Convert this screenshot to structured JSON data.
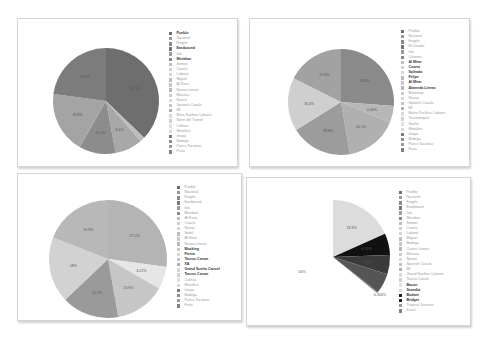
{
  "chart_data": [
    {
      "type": "pie",
      "title": "",
      "slices": [
        {
          "label": "37.2%",
          "value": 37.2,
          "color": "#6e6e6e"
        },
        {
          "label": "",
          "value": 1.5,
          "color": "#bdbdbd"
        },
        {
          "label": "8.4%",
          "value": 8.4,
          "color": "#a8a8a8"
        },
        {
          "label": "11.2%",
          "value": 11.2,
          "color": "#8c8c8c"
        },
        {
          "label": "18.8%",
          "value": 18.8,
          "color": "#a4a4a4"
        },
        {
          "label": "22.9%",
          "value": 22.9,
          "color": "#7c7c7c"
        }
      ],
      "legend": [
        "Pueblo",
        "Nacional",
        "Fragile",
        "Eastbound",
        "Isla",
        "Meridian",
        "Somos",
        "Cuarto",
        "Laboral",
        "Miguel",
        "Al Reos",
        "Nueva Lineas",
        "Mocana",
        "Nouvo",
        "Spanish Canals",
        "Ml",
        "Brisa Sueños Cabaret",
        "Norte del Tunnel",
        "Colinas",
        "Metallico",
        "Ixtapa",
        "Bodega",
        "Pasco Tacanao",
        "Fruta"
      ],
      "legend_bold": [
        0,
        3,
        5
      ],
      "legend_position": "right"
    },
    {
      "type": "pie",
      "title": "",
      "slices": [
        {
          "label": "26.2%",
          "value": 26.2,
          "color": "#8a8a8a"
        },
        {
          "label": "0.06%",
          "value": 5.0,
          "color": "#b7b7b7"
        },
        {
          "label": "16.1%",
          "value": 16.1,
          "color": "#b0b0b0"
        },
        {
          "label": "18.8%",
          "value": 18.8,
          "color": "#9c9c9c"
        },
        {
          "label": "16.3%",
          "value": 16.3,
          "color": "#cfcfcf"
        },
        {
          "label": "17.8%",
          "value": 17.6,
          "color": "#a2a2a2"
        }
      ],
      "legend": [
        "Pueblo",
        "Nacional",
        "Fragile",
        "El Dorado",
        "Isla",
        "Cosmos",
        "Al Mirar",
        "Cuarto",
        "Soleado",
        "Felipe",
        "Al Mirar",
        "Alameda Lineas",
        "Monterey",
        "Nuevo",
        "Spanish Canals",
        "Ml",
        "Bahía Pacífico Cabaret",
        "Tauromaquia",
        "Sueño",
        "Metallico",
        "Ixtapa",
        "Bodega",
        "Pasco Tacanao",
        "Fruta"
      ],
      "legend_bold": [
        6,
        7,
        8,
        9,
        10,
        11
      ],
      "legend_position": "right"
    },
    {
      "type": "pie",
      "title": "",
      "slices": [
        {
          "label": "27.2%",
          "value": 27.2,
          "color": "#b4b4b4"
        },
        {
          "label": "6.12%",
          "value": 6.12,
          "color": "#e6e6e6"
        },
        {
          "label": "13.9%",
          "value": 13.9,
          "color": "#c6c6c6"
        },
        {
          "label": "15.7%",
          "value": 15.7,
          "color": "#9a9a9a"
        },
        {
          "label": "18%",
          "value": 18.0,
          "color": "#d2d2d2"
        },
        {
          "label": "19.3%",
          "value": 19.1,
          "color": "#b8b8b8"
        }
      ],
      "legend": [
        "Pueblo",
        "Nacional",
        "Fragile",
        "Eastbound",
        "Isla",
        "Meridian",
        "Al Reos",
        "Cuarto",
        "Nuevo",
        "Soleil",
        "Al Reos",
        "Nueva Lineas",
        "Mocking",
        "Fiesta",
        "Taurus Canon",
        "XA",
        "Grand Sueño Cancel",
        "Taurus Canon",
        "Colinas",
        "Metallico",
        "Ixtapa",
        "Bodega",
        "Pasco Tacanao",
        "Fruta"
      ],
      "legend_bold": [
        12,
        13,
        14,
        15,
        16,
        17
      ],
      "legend_position": "right"
    },
    {
      "type": "pie",
      "title": "",
      "slices": [
        {
          "label": "18.3%",
          "value": 18.3,
          "color": "#dcdcdc"
        },
        {
          "label": "6.13%",
          "value": 6.13,
          "color": "#111111"
        },
        {
          "label": "5.46%",
          "value": 5.46,
          "color": "#3a3a3a"
        },
        {
          "label": "5.67%",
          "value": 5.67,
          "color": "#555555"
        },
        {
          "label": "0.334%",
          "value": 0.334,
          "color": "#777777"
        },
        {
          "label": "64%",
          "value": 64.1,
          "color": "#ffffff"
        }
      ],
      "legend": [
        "Pueblo",
        "Nacional",
        "Fragile",
        "Eastbound",
        "Isla",
        "Meridian",
        "Somos",
        "Cuarto",
        "Laboral",
        "Miguel",
        "Bodega",
        "Cuarto Lineas",
        "Mocana",
        "Nouvo",
        "Spanish Canals",
        "Ml",
        "Grand Sueños Cabaret",
        "Taurus Canon",
        "Bacon",
        "Scandia",
        "Bodoni",
        "Bridget",
        "Tropical Tacanao",
        "Fusal"
      ],
      "legend_bold": [
        18,
        19,
        20,
        21
      ],
      "legend_position": "right"
    }
  ],
  "panels": [
    {
      "x": 17,
      "y": 18,
      "w": 219,
      "h": 147,
      "cx": 106,
      "cy": 101,
      "r": 53,
      "legend_x": 168,
      "legend_y": 30
    },
    {
      "x": 249,
      "y": 18,
      "w": 219,
      "h": 147,
      "cx": 341,
      "cy": 102,
      "r": 53,
      "legend_x": 400,
      "legend_y": 28
    },
    {
      "x": 17,
      "y": 173,
      "w": 223,
      "h": 146,
      "cx": 108,
      "cy": 259,
      "r": 59,
      "legend_x": 176,
      "legend_y": 184
    },
    {
      "x": 246,
      "y": 177,
      "w": 223,
      "h": 147,
      "cx": 333,
      "cy": 257,
      "r": 57,
      "legend_x": 398,
      "legend_y": 189
    }
  ]
}
